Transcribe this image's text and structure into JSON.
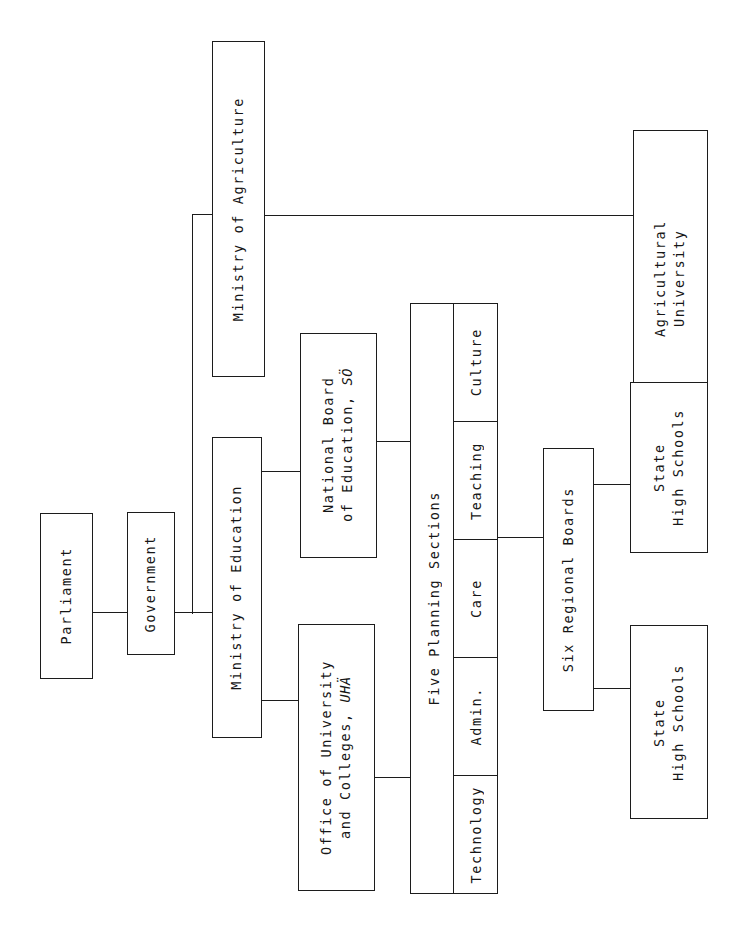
{
  "diagram": {
    "orientation": "rotated-90-ccw",
    "ink_color": "#1c1c1c",
    "background": "#ffffff"
  },
  "nodes": {
    "parliament": {
      "label": "Parliament"
    },
    "government": {
      "label": "Government"
    },
    "ministry_of_education": {
      "label": "Ministry of Education"
    },
    "ministry_of_agriculture": {
      "label": "Ministry of Agriculture"
    },
    "national_board_of_education": {
      "line1": "National Board",
      "line2": "of Education, ",
      "abbr": "SÖ"
    },
    "office_of_university_and_colleges": {
      "line1": "Office of University",
      "line2": "and Colleges, ",
      "abbr": "UHÄ"
    },
    "agricultural_university": {
      "line1": "Agricultural",
      "line2": "University"
    },
    "five_planning_sections": {
      "label": "Five Planning Sections",
      "cells": [
        {
          "label": "Culture"
        },
        {
          "label": "Teaching"
        },
        {
          "label": "Care"
        },
        {
          "label": "Admin."
        },
        {
          "label": "Technology"
        }
      ]
    },
    "six_regional_boards": {
      "label": "Six Regional Boards"
    },
    "state_high_schools_upper": {
      "line1": "State",
      "line2": "High Schools"
    },
    "state_high_schools_lower": {
      "line1": "State",
      "line2": "High Schools"
    }
  },
  "edges": [
    {
      "from": "parliament",
      "to": "government"
    },
    {
      "from": "government",
      "to": "ministry_of_education"
    },
    {
      "from": "government",
      "to": "ministry_of_agriculture"
    },
    {
      "from": "ministry_of_education",
      "to": "national_board_of_education"
    },
    {
      "from": "ministry_of_education",
      "to": "office_of_university_and_colleges"
    },
    {
      "from": "ministry_of_agriculture",
      "to": "agricultural_university"
    },
    {
      "from": "national_board_of_education",
      "to": "five_planning_sections"
    },
    {
      "from": "office_of_university_and_colleges",
      "to": "five_planning_sections"
    },
    {
      "from": "five_planning_sections",
      "to": "six_regional_boards"
    },
    {
      "from": "six_regional_boards",
      "to": "state_high_schools_upper"
    },
    {
      "from": "six_regional_boards",
      "to": "state_high_schools_lower"
    }
  ]
}
